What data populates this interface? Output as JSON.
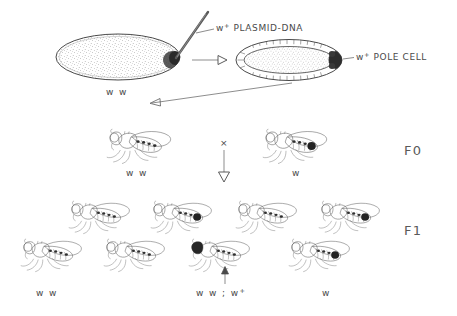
{
  "figure": {
    "type": "diagram",
    "colors": {
      "ink": "#4a4a4a",
      "ink_light": "#6a6a6a",
      "fill_body": "#e8e8e8",
      "fill_dark": "#2a2a2a",
      "background": "#ffffff"
    }
  },
  "injection": {
    "plasmid_label": "PLASMID-DNA",
    "plasmid_allele": "w",
    "plasmid_allele_sup": "+",
    "pole_cell_label": "POLE CELL",
    "pole_cell_allele": "w",
    "pole_cell_allele_sup": "+",
    "embryo_genotype": "w w",
    "needle_name": "injection-needle",
    "arrow_name": "development-arrow"
  },
  "generations": {
    "f0": {
      "label": "F0",
      "cross_symbol": "×",
      "flies": [
        {
          "genotype": "w w",
          "eye": "white",
          "marked": false
        },
        {
          "genotype": "w",
          "eye": "white",
          "marked": true
        }
      ]
    },
    "f1": {
      "label": "F1",
      "row_top_count": 4,
      "row_bottom_count": 4,
      "genotype_left": "w w",
      "genotype_center": "w w ;  w",
      "genotype_center_sup": "+",
      "genotype_right": "w",
      "transformant_index": 2,
      "pointer_name": "transformant-pointer-arrow"
    }
  }
}
